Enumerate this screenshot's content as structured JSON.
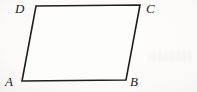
{
  "figure": {
    "type": "geometry-diagram",
    "shape": "parallelogram",
    "polygon_points": "36,6 140,5 126,80 22,81",
    "stroke_color": "#1f1f1f",
    "fill_color": "#fdfdfc",
    "vertices": [
      {
        "label": "A",
        "corner": "bottom-left"
      },
      {
        "label": "B",
        "corner": "bottom-right"
      },
      {
        "label": "C",
        "corner": "top-right"
      },
      {
        "label": "D",
        "corner": "top-left"
      }
    ],
    "labels": {
      "a": "A",
      "b": "B",
      "c": "C",
      "d": "D"
    }
  }
}
